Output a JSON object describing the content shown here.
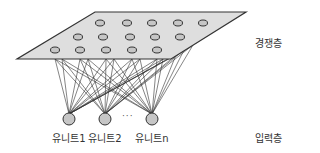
{
  "layers": {
    "competitive": {
      "label": "경쟁층"
    },
    "input": {
      "label": "입력층"
    }
  },
  "input_units": [
    {
      "label": "유니트1",
      "x": 69,
      "y": 119
    },
    {
      "label": "유니트2",
      "x": 105,
      "y": 119
    },
    {
      "label": "유니트n",
      "x": 152,
      "y": 119
    }
  ],
  "ellipsis": "···",
  "plane": {
    "corners": [
      [
        95,
        12
      ],
      [
        246,
        12
      ],
      [
        171,
        59
      ],
      [
        17,
        59
      ]
    ],
    "fill": "#dedede",
    "stroke": "#333333"
  },
  "competitive_nodes": [
    [
      100,
      23
    ],
    [
      127,
      23
    ],
    [
      152,
      23
    ],
    [
      178,
      23
    ],
    [
      203,
      23
    ],
    [
      78,
      37
    ],
    [
      103,
      37
    ],
    [
      130,
      37
    ],
    [
      155,
      37
    ],
    [
      180,
      37
    ],
    [
      55,
      50
    ],
    [
      80,
      50
    ],
    [
      106,
      50
    ],
    [
      132,
      50
    ],
    [
      157,
      50
    ]
  ],
  "connection_targets": [
    [
      55,
      59
    ],
    [
      62,
      59
    ],
    [
      80,
      59
    ],
    [
      88,
      59
    ],
    [
      106,
      59
    ],
    [
      114,
      59
    ],
    [
      132,
      59
    ],
    [
      140,
      59
    ],
    [
      157,
      59
    ],
    [
      163,
      59
    ],
    [
      176,
      55
    ],
    [
      184,
      50
    ],
    [
      193,
      45
    ]
  ],
  "colors": {
    "node_fill": "#c6c6c6",
    "node_stroke": "#333333",
    "line": "#333333"
  }
}
